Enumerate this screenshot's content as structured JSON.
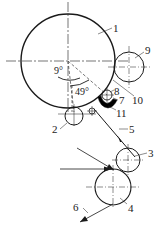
{
  "diagram": {
    "type": "roller arrangement schematic",
    "labels": {
      "l1": "1",
      "l2": "2",
      "l3": "3",
      "l4": "4",
      "l5": "5",
      "l6": "6",
      "l7": "7",
      "l8": "8",
      "l9": "9",
      "l10": "10",
      "l11": "11"
    },
    "angles": {
      "a1": "9°",
      "a2": "49°"
    },
    "colors": {
      "stroke": "#1a1a1a",
      "fill_block": "#000000",
      "background": "#ffffff"
    }
  }
}
